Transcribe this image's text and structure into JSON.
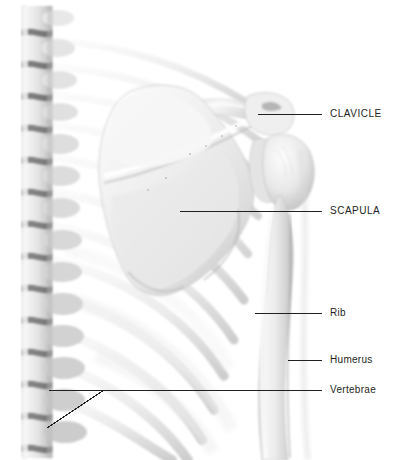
{
  "figure": {
    "background_color": "#ffffff",
    "width": 400,
    "height": 460,
    "line_color": "#231f20",
    "text_color": "#231f20",
    "bone_light": "#f4f4f4",
    "bone_mid": "#dcdcdc",
    "bone_shadow": "#a8a8a8",
    "bone_dark": "#6e6e6e"
  },
  "labels": [
    {
      "id": "clavicle",
      "text": "CLAVICLE",
      "style": "uppercase",
      "text_x": 330,
      "text_y": 109,
      "leader": "M258,114 L322,114"
    },
    {
      "id": "scapula",
      "text": "SCAPULA",
      "style": "uppercase",
      "text_x": 330,
      "text_y": 206,
      "leader": "M180,211 L322,211"
    },
    {
      "id": "rib",
      "text": "Rib",
      "style": "titlecase",
      "text_x": 330,
      "text_y": 308,
      "leader": "M255,313 L322,313"
    },
    {
      "id": "humerus",
      "text": "Humerus",
      "style": "titlecase",
      "text_x": 330,
      "text_y": 355,
      "leader": "M288,360 L322,360"
    },
    {
      "id": "vertebrae",
      "text": "Vertebrae",
      "style": "titlecase",
      "text_x": 330,
      "text_y": 385,
      "leader": "M49,390 L322,390 M104,390 L47,428"
    }
  ],
  "structures": [
    {
      "id": "vertebral-column",
      "name": "vertebral column",
      "segments": 14
    },
    {
      "id": "rib-cage",
      "name": "rib cage",
      "ribs": 9
    },
    {
      "id": "scapula-blade",
      "name": "scapula"
    },
    {
      "id": "clavicle-bone",
      "name": "clavicle"
    },
    {
      "id": "humerus-bone",
      "name": "humerus"
    }
  ]
}
